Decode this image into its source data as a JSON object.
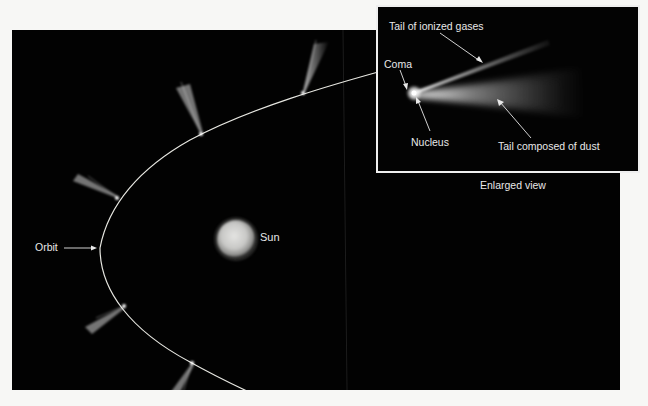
{
  "diagram": {
    "main_view": {
      "labels": {
        "orbit": "Orbit",
        "sun": "Sun"
      },
      "comet_positions": [
        {
          "id": 1,
          "head": [
            303,
            93
          ],
          "tail_end": [
            323,
            42
          ]
        },
        {
          "id": 2,
          "head": [
            201,
            134
          ],
          "tail_end": [
            183,
            85
          ]
        },
        {
          "id": 3,
          "head": [
            117,
            198
          ],
          "tail_end": [
            75,
            180
          ]
        },
        {
          "id": 4,
          "head": [
            124,
            306
          ],
          "tail_end": [
            88,
            330
          ]
        },
        {
          "id": 5,
          "head": [
            192,
            363
          ],
          "tail_end": [
            172,
            398
          ]
        }
      ],
      "note": "Tails always point away from the Sun"
    },
    "inset": {
      "caption": "Enlarged view",
      "labels": {
        "ion_tail": "Tail of ionized gases",
        "coma": "Coma",
        "nucleus": "Nucleus",
        "dust_tail": "Tail composed of dust"
      }
    },
    "colors": {
      "background": "#020202",
      "page": "#f7f7f5",
      "orbit_line": "#e6e6e0",
      "label_text": "#e8e8e8",
      "inset_border": "#efefef"
    }
  }
}
